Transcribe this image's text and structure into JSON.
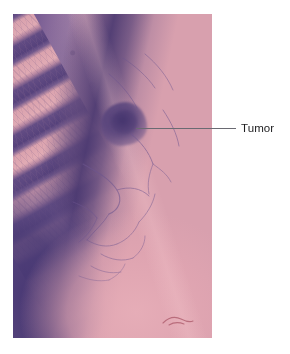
{
  "figure": {
    "kind": "medical-photograph",
    "background_color": "#ffffff"
  },
  "photo": {
    "alt_description": "Histologic / gross pathology photograph of lung tissue showing ribs at left and a darker tumor mass in the upper-central lung field",
    "x": 13,
    "y": 14,
    "width": 199,
    "height": 324,
    "palette": {
      "pink_tissue": "#dfa6b3",
      "pale_pink": "#f0bcc4",
      "purple_dark": "#483a70",
      "purple_mid": "#6b5590",
      "mauve": "#b98fa8",
      "ink_red": "#96394c"
    },
    "features": [
      {
        "name": "rib-cage",
        "position": "left, diagonal bands"
      },
      {
        "name": "intercostal-shadow",
        "position": "between ribs"
      },
      {
        "name": "upper-lung-opacity",
        "position": "upper center"
      },
      {
        "name": "tumor-mass",
        "position": "upper center-left"
      },
      {
        "name": "vascular-markings",
        "position": "center and lower lung"
      },
      {
        "name": "diaphragm-field",
        "position": "lower right"
      },
      {
        "name": "ink-mark",
        "position": "bottom right"
      }
    ]
  },
  "annotation": {
    "label": "Tumor",
    "label_color": "#1d1d1f",
    "leader_line_color": "#6a6a72",
    "leader_line": {
      "x1": 136,
      "y1": 128,
      "x2": 236,
      "y2": 128
    },
    "label_position": {
      "x": 241,
      "y": 121
    },
    "points_to": "tumor-mass"
  }
}
